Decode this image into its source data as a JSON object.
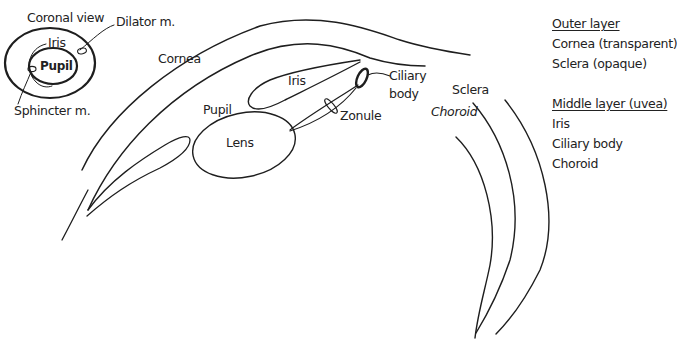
{
  "diagram": {
    "inset": {
      "title": "Coronal view",
      "labels": {
        "iris": "Iris",
        "pupil": "Pupil",
        "dilator": "Dilator m.",
        "sphincter": "Sphincter m."
      }
    },
    "labels": {
      "cornea": "Cornea",
      "iris": "Iris",
      "pupil": "Pupil",
      "lens": "Lens",
      "zonule": "Zonule",
      "ciliary_line1": "Ciliary",
      "ciliary_line2": "body",
      "sclera": "Sclera",
      "choroid": "Choroid"
    },
    "stroke_color": "#1e1e1e"
  },
  "legend": {
    "groups": [
      {
        "header": "Outer layer",
        "items": [
          "Cornea (transparent)",
          "Sclera (opaque)"
        ]
      },
      {
        "header": "Middle layer (uvea)",
        "items": [
          "Iris",
          "Ciliary body",
          "Choroid"
        ]
      }
    ]
  }
}
